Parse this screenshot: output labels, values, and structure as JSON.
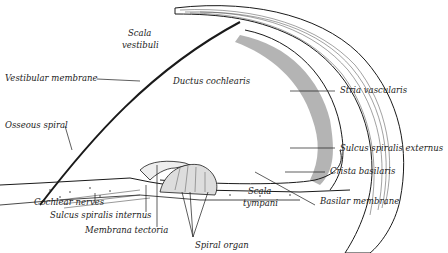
{
  "figure": {
    "colors": {
      "ink": "#1a1a1a",
      "background": "#ffffff",
      "tissue": "#888888"
    }
  },
  "labels": {
    "scala_vestibuli_1": "Scala",
    "scala_vestibuli_2": "vestibuli",
    "vestibular_membrane": "Vestibular membrane",
    "ductus_cochlearis": "Ductus cochlearis",
    "osseous_spiral": "Osseous spiral",
    "stria_vascularis": "Stria vascularis",
    "sulcus_spiralis_externus": "Sulcus spiralis externus",
    "crista_basilaris": "Crista basilaris",
    "cochlear_nerves": "Cochlear nerves",
    "scala_tympani_1": "Scala",
    "scala_tympani_2": "tympani",
    "basilar_membrane": "Basilar membrane",
    "sulcus_spiralis_internus": "Sulcus spiralis internus",
    "membrana_tectoria": "Membrana tectoria",
    "spiral_organ": "Spiral organ"
  }
}
